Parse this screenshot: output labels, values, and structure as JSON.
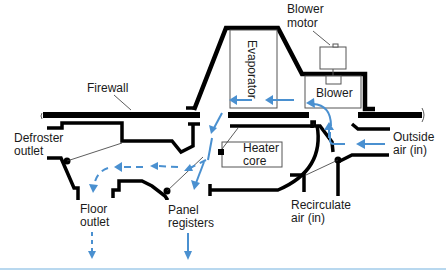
{
  "diagram": {
    "labels": {
      "blower_motor_line1": "Blower",
      "blower_motor_line2": "motor",
      "evaporator": "Evaporator",
      "blower": "Blower",
      "firewall": "Firewall",
      "defroster_line1": "Defroster",
      "defroster_line2": "outlet",
      "heater_core_line1": "Heater",
      "heater_core_line2": "core",
      "outside_air_line1": "Outside",
      "outside_air_line2": "air (in)",
      "recirculate_line1": "Recirculate",
      "recirculate_line2": "air (in)",
      "floor_outlet_line1": "Floor",
      "floor_outlet_line2": "outlet",
      "panel_registers_line1": "Panel",
      "panel_registers_line2": "registers"
    },
    "colors": {
      "airflow": "#4a90d0",
      "structure": "#000000",
      "bottom_rule": "#b8d8ef"
    }
  }
}
